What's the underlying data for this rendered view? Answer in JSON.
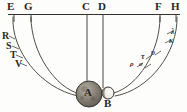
{
  "figure": {
    "kind": "astronomical-diagram-engraving",
    "background_color": "#fdfdfc",
    "ink_color": "#2b2723",
    "width": 187,
    "height": 112
  },
  "top_labels": [
    {
      "text": "E",
      "x": 7,
      "y": 2
    },
    {
      "text": "G",
      "x": 25,
      "y": 2
    },
    {
      "text": "C",
      "x": 83,
      "y": 2
    },
    {
      "text": "D",
      "x": 99,
      "y": 2
    },
    {
      "text": "F",
      "x": 155,
      "y": 2
    },
    {
      "text": "H",
      "x": 171,
      "y": 2
    }
  ],
  "left_labels": [
    {
      "text": "R",
      "x": 3,
      "y": 35
    },
    {
      "text": "S",
      "x": 7,
      "y": 45
    },
    {
      "text": "T",
      "x": 11,
      "y": 54
    },
    {
      "text": "V",
      "x": 16,
      "y": 62
    }
  ],
  "right_labels": [
    {
      "text": "τ",
      "x": 140,
      "y": 57
    },
    {
      "text": "υ",
      "x": 150,
      "y": 54
    },
    {
      "text": "ρ",
      "x": 130,
      "y": 64
    },
    {
      "text": "σ",
      "x": 139,
      "y": 65
    },
    {
      "text": "λ",
      "x": 170,
      "y": 32
    },
    {
      "text": "κ",
      "x": 168,
      "y": 41
    }
  ],
  "bodies": [
    {
      "name": "A",
      "label": "A",
      "cx": 89,
      "cy": 94,
      "r": 13,
      "style": "shaded-stippled-sphere",
      "label_x": 85,
      "label_y": 88
    },
    {
      "name": "B",
      "label": "B",
      "cx": 108,
      "cy": 93,
      "r": 6,
      "style": "light-crescent-sphere",
      "label_x": 106,
      "label_y": 99
    }
  ],
  "baseline": {
    "y": 14,
    "x1": 8,
    "x2": 180
  },
  "verticals": [
    {
      "label": "E",
      "x": 14,
      "y1": 14,
      "y2": 21
    },
    {
      "label": "G",
      "x": 31,
      "y1": 14,
      "y2": 21
    },
    {
      "label": "C",
      "x": 87,
      "y1": 14,
      "y2": 86
    },
    {
      "label": "D",
      "x": 103,
      "y1": 14,
      "y2": 88
    },
    {
      "label": "F",
      "x": 160,
      "y1": 14,
      "y2": 21
    },
    {
      "label": "H",
      "x": 176,
      "y1": 14,
      "y2": 21
    }
  ],
  "arcs": [
    {
      "name": "arc-E-outer-left",
      "from": "E",
      "to": "A"
    },
    {
      "name": "arc-G-inner-left",
      "from": "G",
      "to": "A"
    },
    {
      "name": "arc-F-inner-right",
      "from": "F",
      "to": "B"
    },
    {
      "name": "arc-H-outer-right",
      "from": "H",
      "to": "B"
    }
  ],
  "tick_marks": {
    "left_count": 4,
    "right_count": 6
  }
}
